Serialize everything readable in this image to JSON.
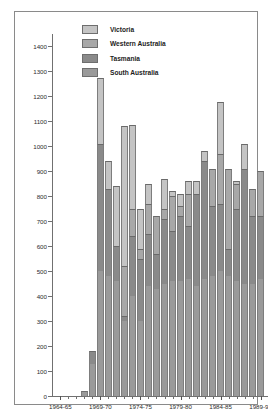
{
  "chart_data": {
    "type": "bar",
    "subtype": "stacked-bar",
    "title": "",
    "xlabel": "",
    "ylabel": "",
    "ylim": [
      0,
      1450
    ],
    "yticks": [
      0,
      100,
      200,
      300,
      400,
      500,
      600,
      700,
      800,
      900,
      1000,
      1100,
      1200,
      1300,
      1400
    ],
    "grid": false,
    "legend_position": "inside-top-center",
    "categories": [
      "1964-65",
      "1965-66",
      "1966-67",
      "1967-68",
      "1968-69",
      "1969-70",
      "1970-71",
      "1971-72",
      "1972-73",
      "1973-74",
      "1974-75",
      "1975-76",
      "1976-77",
      "1977-78",
      "1978-79",
      "1979-80",
      "1980-81",
      "1981-82",
      "1982-83",
      "1983-84",
      "1984-85",
      "1985-86",
      "1986-87",
      "1987-88",
      "1988-89",
      "1989-90"
    ],
    "xtick_labels": [
      "1964-65",
      "1969-70",
      "1974-75",
      "1979-80",
      "1984-85",
      "1989-90"
    ],
    "xtick_category_index": [
      0,
      5,
      10,
      15,
      20,
      25
    ],
    "series": [
      {
        "name": "South Australia",
        "color": "#9a9a9a",
        "values": [
          0,
          0,
          0,
          20,
          130,
          500,
          480,
          460,
          300,
          400,
          300,
          440,
          430,
          450,
          460,
          460,
          470,
          440,
          470,
          480,
          500,
          480,
          460,
          450,
          450,
          470
        ]
      },
      {
        "name": "Tasmania",
        "color": "#8a8a8a",
        "values": [
          0,
          0,
          0,
          0,
          50,
          510,
          350,
          140,
          20,
          240,
          250,
          210,
          140,
          260,
          200,
          260,
          210,
          370,
          470,
          280,
          270,
          110,
          290,
          460,
          270,
          250
        ]
      },
      {
        "name": "Western Australia",
        "color": "#a8a8a8",
        "values": [
          0,
          0,
          0,
          0,
          0,
          0,
          0,
          0,
          200,
          110,
          40,
          120,
          150,
          40,
          140,
          40,
          130,
          0,
          0,
          150,
          200,
          320,
          100,
          0,
          110,
          180
        ]
      },
      {
        "name": "Victoria",
        "color": "#c4c4c4",
        "values": [
          0,
          0,
          0,
          0,
          0,
          262,
          110,
          240,
          560,
          335,
          160,
          80,
          0,
          120,
          20,
          50,
          50,
          50,
          40,
          0,
          208,
          0,
          10,
          100,
          0,
          0
        ]
      }
    ],
    "totals": [
      0,
      0,
      0,
      20,
      180,
      1272,
      940,
      840,
      1080,
      1085,
      750,
      850,
      720,
      870,
      820,
      810,
      860,
      810,
      980,
      910,
      1178,
      910,
      860,
      1010,
      830,
      900
    ]
  },
  "legend": {
    "items": [
      {
        "label": "Victoria",
        "color": "#c4c4c4"
      },
      {
        "label": "Western Australia",
        "color": "#a8a8a8"
      },
      {
        "label": "Tasmania",
        "color": "#8a8a8a"
      },
      {
        "label": "South Australia",
        "color": "#9a9a9a"
      }
    ]
  }
}
